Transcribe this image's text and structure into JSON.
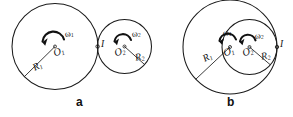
{
  "figure": {
    "background_color": "#ffffff",
    "ink_color": "#141414",
    "panels": [
      {
        "id": "a",
        "letter": "a",
        "tangency": "external",
        "labels": {
          "omega1": "ω",
          "omega1_sub": "1",
          "omega2": "ω",
          "omega2_sub": "2",
          "center1": "O",
          "center1_sub": "1",
          "center2": "O",
          "center2_sub": "2",
          "radius1": "R",
          "radius1_sub": "1",
          "radius2": "R",
          "radius2_sub": "2",
          "contact_point": "I"
        }
      },
      {
        "id": "b",
        "letter": "b",
        "tangency": "internal",
        "labels": {
          "omega1": "ω",
          "omega1_sub": "1",
          "omega2": "ω",
          "omega2_sub": "2",
          "center1": "O",
          "center1_sub": "1",
          "center2": "O",
          "center2_sub": "2",
          "radius1": "R",
          "radius1_sub": "1",
          "radius2": "R",
          "radius2_sub": "2",
          "contact_point": "I"
        }
      }
    ]
  }
}
